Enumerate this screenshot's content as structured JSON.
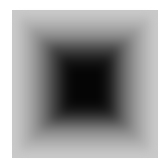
{
  "image": {
    "description": "Square grayscale gradient, dark center fading to light gray edges",
    "background": "#ffffff",
    "colors": {
      "outer": "#c9c9c9",
      "mid": "#6e6e6e",
      "center": "#050505"
    }
  }
}
